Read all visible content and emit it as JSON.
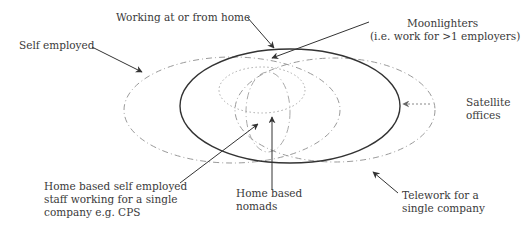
{
  "diagram": {
    "labels": {
      "working_home": "Working at or from home",
      "self_employed": "Self employed",
      "moonlighters_1": "Moonlighters",
      "moonlighters_2": "(i.e. work for >1 employers)",
      "satellite_1": "Satellite",
      "satellite_2": "offices",
      "home_self_1": "Home based self employed",
      "home_self_2": "staff working for a single",
      "home_self_3": "company e.g. CPS",
      "nomads_1": "Home based",
      "nomads_2": "nomads",
      "telework_1": "Telework for a",
      "telework_2": "single company"
    },
    "colors": {
      "solid": "#333333",
      "dashed": "#999999",
      "dotted": "#aaaaaa"
    }
  }
}
